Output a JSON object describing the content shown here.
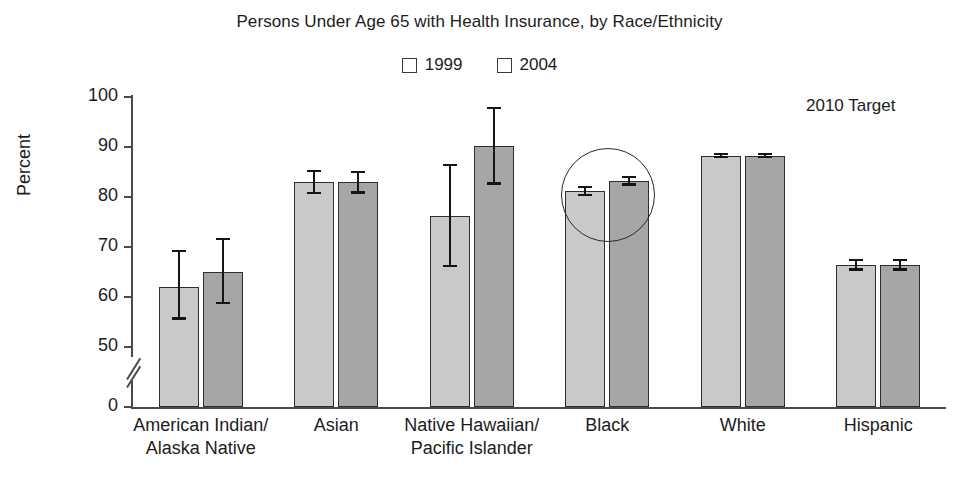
{
  "chart_data": {
    "type": "bar",
    "title": "Persons Under Age 65 with Health Insurance, by Race/Ethnicity",
    "xlabel": "",
    "ylabel": "Percent",
    "ylim": [
      50,
      100
    ],
    "y_axis_break": true,
    "y_zero_shown": true,
    "yticks": [
      "100",
      "90",
      "80",
      "70",
      "60",
      "50",
      "0"
    ],
    "ytick_values": [
      100,
      90,
      80,
      70,
      60,
      50,
      0
    ],
    "grid": false,
    "legend_position": "top-center",
    "categories": [
      "American Indian/\nAlaska Native",
      "Asian",
      "Native Hawaiian/\nPacific Islander",
      "Black",
      "White",
      "Hispanic"
    ],
    "series": [
      {
        "name": "1999",
        "color": "#c9c9c9",
        "values": [
          62.0,
          83.0,
          76.3,
          81.2,
          88.3,
          66.4
        ],
        "error_low": [
          55.5,
          80.6,
          66.0,
          80.2,
          87.8,
          65.3
        ],
        "error_high": [
          69.5,
          85.4,
          86.6,
          82.3,
          88.9,
          67.6
        ]
      },
      {
        "name": "2004",
        "color": "#a6a6a6",
        "values": [
          65.1,
          83.0,
          90.2,
          83.3,
          88.3,
          66.4
        ],
        "error_low": [
          58.6,
          80.7,
          82.5,
          82.3,
          87.8,
          65.3
        ],
        "error_high": [
          71.9,
          85.3,
          98.0,
          84.3,
          88.9,
          67.6
        ]
      }
    ],
    "annotations": [
      {
        "name": "target-label",
        "text": "2010 Target"
      },
      {
        "name": "highlight-circle",
        "target_category": "Black"
      }
    ]
  },
  "legend": {
    "items": [
      {
        "label": "1999",
        "color": "#c9c9c9"
      },
      {
        "label": "2004",
        "color": "#a6a6a6"
      }
    ]
  }
}
